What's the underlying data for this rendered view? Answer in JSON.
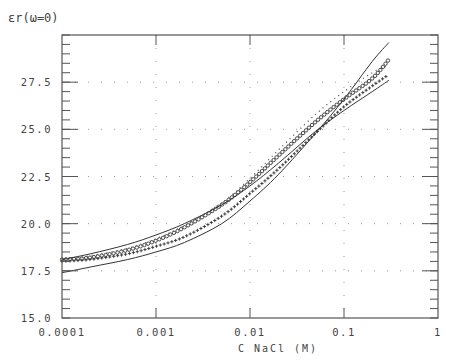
{
  "chart_data": {
    "type": "line",
    "title": "",
    "ylabel": "εr(ω=0)",
    "xlabel": "C NaCl (M)",
    "xscale": "log",
    "xlim": [
      0.0001,
      1
    ],
    "ylim": [
      15.0,
      30.0
    ],
    "x_ticks": [
      "0.0001",
      "0.001",
      "0.01",
      "0.1",
      "1"
    ],
    "y_ticks": [
      "15.0",
      "17.5",
      "20.0",
      "22.5",
      "25.0",
      "27.5"
    ],
    "grid": "dotted",
    "legend": "none",
    "x": [
      0.0001,
      0.0002,
      0.0005,
      0.001,
      0.002,
      0.005,
      0.01,
      0.02,
      0.05,
      0.1,
      0.2,
      0.3
    ],
    "series": [
      {
        "name": "smooth curve A (upper at low C)",
        "style": "solid",
        "values": [
          18.1,
          18.4,
          18.9,
          19.4,
          20.0,
          21.0,
          22.0,
          23.2,
          24.9,
          26.0,
          27.0,
          27.6
        ]
      },
      {
        "name": "smooth curve B (steep)",
        "style": "solid",
        "values": [
          17.4,
          17.7,
          18.1,
          18.5,
          19.0,
          20.0,
          21.2,
          22.6,
          24.8,
          26.6,
          28.6,
          29.6
        ]
      },
      {
        "name": "circle markers",
        "style": "markers-o",
        "values": [
          18.1,
          18.2,
          18.6,
          19.1,
          19.8,
          21.0,
          22.2,
          23.6,
          25.4,
          26.6,
          27.7,
          28.7
        ]
      },
      {
        "name": "plus markers",
        "style": "markers-+",
        "values": [
          18.0,
          18.1,
          18.4,
          18.8,
          19.3,
          20.4,
          21.6,
          22.9,
          24.8,
          26.2,
          27.3,
          27.9
        ]
      },
      {
        "name": "dotted curve",
        "style": "dotted",
        "values": [
          18.1,
          18.3,
          18.7,
          19.2,
          19.9,
          21.1,
          22.4,
          23.9,
          25.8,
          27.0,
          28.0,
          28.4
        ]
      }
    ]
  }
}
